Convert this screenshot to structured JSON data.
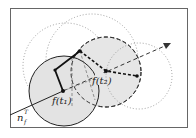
{
  "diagram": {
    "labels": {
      "f_t1": "f(t₁)",
      "t2": "f(t₂)",
      "normal": "n",
      "normal_sup": "T",
      "normal_sub": "f"
    },
    "colors": {
      "frame": "#555555",
      "circle_fill": "#e3e3e3",
      "stroke": "#222222",
      "dotted": "#888888"
    }
  }
}
